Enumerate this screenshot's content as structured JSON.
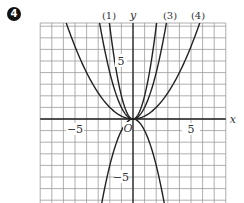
{
  "problem_number": "4",
  "chart_data": {
    "type": "line",
    "title": "",
    "xlabel": "x",
    "ylabel": "y",
    "origin_label": "O",
    "xlim": [
      -8,
      8
    ],
    "ylim": [
      -7.2,
      8.2
    ],
    "grid": true,
    "x_ticks": [
      {
        "value": -5,
        "label": "−5"
      },
      {
        "value": 5,
        "label": "5"
      }
    ],
    "y_ticks": [
      {
        "value": 5,
        "label": "5"
      },
      {
        "value": -5,
        "label": "−5"
      }
    ],
    "series": [
      {
        "name": "(1)",
        "label": "(1)",
        "formula": "y = 2x^2",
        "coef": 2
      },
      {
        "name": "(2)",
        "label": "",
        "formula": "y = -x^2",
        "coef": -1
      },
      {
        "name": "(3)",
        "label": "(3)",
        "formula": "y = x^2",
        "coef": 1
      },
      {
        "name": "(4)",
        "label": "(4)",
        "formula": "y = x^2/4",
        "coef": 0.25
      }
    ]
  },
  "colors": {
    "grid": "#9a9a9a",
    "axis": "#222222",
    "curve": "#222222",
    "text": "#333333"
  }
}
